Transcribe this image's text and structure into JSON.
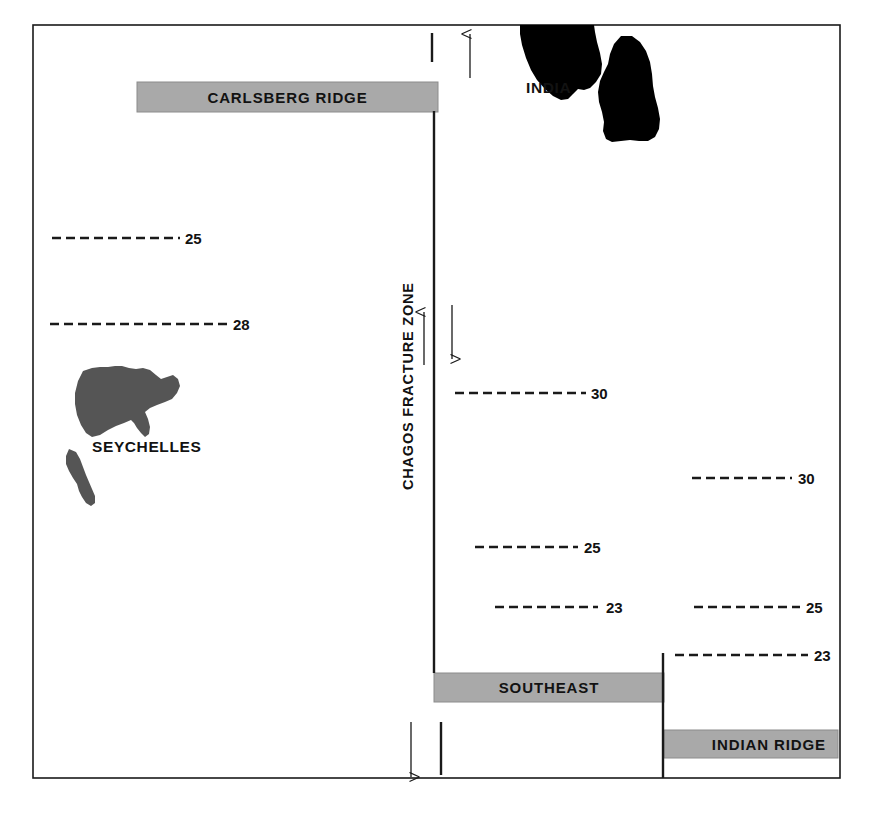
{
  "figure": {
    "background_color": "#ffffff",
    "frame": {
      "name": "outer-frame",
      "x": 33,
      "y": 25,
      "width": 807,
      "height": 753,
      "stroke_color": "#1a1a1a",
      "stroke_width": 1.6
    },
    "colors": {
      "ridge_bar_fill": "#a9a9a9",
      "ridge_bar_stroke": "#8c8c8c",
      "landmass_dark": "#000000",
      "landmass_gray": "#555555",
      "line_color": "#1a1a1a",
      "text_color": "#121212"
    }
  },
  "ridges": [
    {
      "name": "carlsberg-ridge",
      "label": "CARLSBERG RIDGE",
      "x": 137,
      "y": 82,
      "width": 301,
      "height": 30,
      "text_align": "center"
    },
    {
      "name": "southeast-ridge",
      "label": "SOUTHEAST",
      "x": 434,
      "y": 673,
      "width": 230,
      "height": 29,
      "text_align": "center"
    },
    {
      "name": "indian-ridge",
      "label": "INDIAN RIDGE",
      "x": 664,
      "y": 730,
      "width": 174,
      "height": 28,
      "text_align": "right"
    }
  ],
  "fracture_zone": {
    "name": "chagos-fracture-zone",
    "label": "CHAGOS FRACTURE ZONE",
    "label_x": 413,
    "label_y": 490,
    "rotation_deg": -90,
    "main_line": {
      "x": 434,
      "y1": 111,
      "y2": 673
    },
    "lower_line": {
      "x": 663,
      "y1": 653,
      "y2": 778
    }
  },
  "tick_marks": [
    {
      "name": "tick-top",
      "x": 432,
      "y1": 33,
      "y2": 62
    },
    {
      "name": "tick-bottom",
      "x": 441,
      "y1": 722,
      "y2": 775
    }
  ],
  "motion_arrows": [
    {
      "name": "arrow-up-india",
      "x": 470,
      "y_tail": 78,
      "y_head": 33,
      "direction": "up"
    },
    {
      "name": "arrow-up-west-flank",
      "x": 424,
      "y_tail": 365,
      "y_head": 311,
      "direction": "up"
    },
    {
      "name": "arrow-down-east-flank",
      "x": 452,
      "y_tail": 305,
      "y_head": 360,
      "direction": "down"
    },
    {
      "name": "arrow-down-southwest",
      "x": 411,
      "y_tail": 722,
      "y_head": 778,
      "direction": "down"
    }
  ],
  "landmasses": [
    {
      "name": "india-landmass-upper",
      "label": "INDIA",
      "fill": "#000000",
      "label_x": 526,
      "label_y": 93
    },
    {
      "name": "india-landmass-lower",
      "fill": "#000000"
    },
    {
      "name": "seychelles-landmass",
      "label": "SEYCHELLES",
      "fill": "#555555",
      "label_x": 92,
      "label_y": 452
    },
    {
      "name": "seychelles-islet",
      "fill": "#555555"
    }
  ],
  "magnetic_anomalies": [
    {
      "name": "anomaly-25-northwest",
      "value": "25",
      "x1": 52,
      "x2": 180,
      "y": 238,
      "label_x": 185
    },
    {
      "name": "anomaly-28-west",
      "value": "28",
      "x1": 50,
      "x2": 228,
      "y": 324,
      "label_x": 233
    },
    {
      "name": "anomaly-30-center",
      "value": "30",
      "x1": 455,
      "x2": 586,
      "y": 393,
      "label_x": 591
    },
    {
      "name": "anomaly-30-east",
      "value": "30",
      "x1": 692,
      "x2": 792,
      "y": 478,
      "label_x": 798
    },
    {
      "name": "anomaly-25-center",
      "value": "25",
      "x1": 475,
      "x2": 578,
      "y": 547,
      "label_x": 584
    },
    {
      "name": "anomaly-23-center",
      "value": "23",
      "x1": 495,
      "x2": 598,
      "y": 607,
      "label_x": 606
    },
    {
      "name": "anomaly-25-southeast",
      "value": "25",
      "x1": 694,
      "x2": 800,
      "y": 607,
      "label_x": 806
    },
    {
      "name": "anomaly-23-southeast",
      "value": "23",
      "x1": 675,
      "x2": 808,
      "y": 655,
      "label_x": 814
    }
  ]
}
